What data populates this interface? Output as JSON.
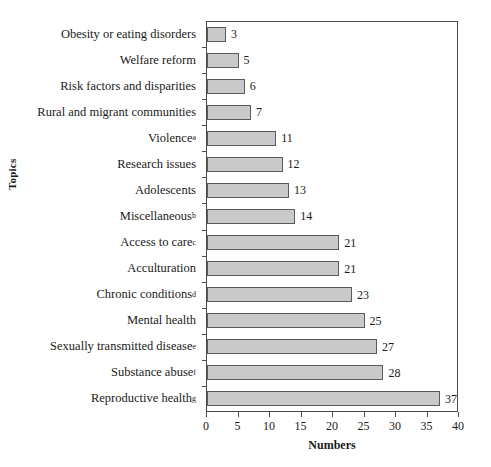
{
  "chart_data": {
    "type": "bar",
    "orientation": "horizontal",
    "title": "",
    "xlabel": "Numbers",
    "ylabel": "Topics",
    "xlim": [
      0,
      40
    ],
    "xticks": [
      0,
      5,
      10,
      15,
      20,
      25,
      30,
      35,
      40
    ],
    "grid": false,
    "legend": null,
    "bar_fill_color": "#c9c9c9",
    "bar_border_color": "#5a5a5a",
    "categories": [
      "Obesity or eating disorders",
      "Welfare reform",
      "Risk factors and disparities",
      "Rural and migrant communities",
      "Violence",
      "Research issues",
      "Adolescents",
      "Miscellaneous",
      "Access to care",
      "Acculturation",
      "Chronic conditions",
      "Mental health",
      "Sexually transmitted disease",
      "Substance abuse",
      "Reproductive health"
    ],
    "category_superscripts": [
      "",
      "",
      "",
      "",
      "a",
      "",
      "",
      "b",
      "c",
      "",
      "d",
      "",
      "e",
      "f",
      "g"
    ],
    "values": [
      3,
      5,
      6,
      7,
      11,
      12,
      13,
      14,
      21,
      21,
      23,
      25,
      27,
      28,
      37
    ],
    "value_labels": [
      "3",
      "5",
      "6",
      "7",
      "11",
      "12",
      "13",
      "14",
      "21",
      "21",
      "23",
      "25",
      "27",
      "28",
      "37"
    ]
  }
}
